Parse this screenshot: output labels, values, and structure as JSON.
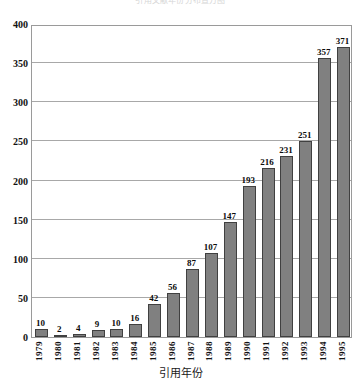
{
  "chart_data": {
    "type": "bar",
    "title": "引用文献年份分布直方图",
    "xlabel": "引用年份",
    "ylabel": "",
    "categories": [
      "1979",
      "1980",
      "1981",
      "1982",
      "1983",
      "1984",
      "1985",
      "1986",
      "1987",
      "1988",
      "1989",
      "1990",
      "1991",
      "1992",
      "1993",
      "1994",
      "1995"
    ],
    "values": [
      10,
      2,
      4,
      9,
      10,
      16,
      42,
      56,
      87,
      107,
      147,
      193,
      216,
      231,
      251,
      357,
      371
    ],
    "ylim": [
      0,
      400
    ],
    "yticks": [
      0,
      50,
      100,
      150,
      200,
      250,
      300,
      350,
      400
    ],
    "ytick_labels": [
      "0",
      "50",
      "100",
      "150",
      "200",
      "250",
      "300",
      "350",
      "400"
    ],
    "grid": true,
    "legend": false,
    "bar_color": "#808080",
    "bar_border_color": "#404040",
    "grid_color": "#a8a8a8",
    "show_value_labels": true
  }
}
